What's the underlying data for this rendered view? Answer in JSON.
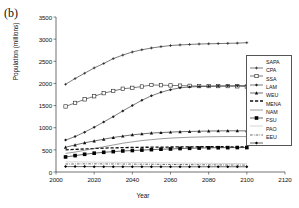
{
  "figure": {
    "panel_label": "(b)",
    "xlabel": "Year",
    "ylabel": "Population (millions)"
  },
  "axes": {
    "ytick_labels": [
      "3500",
      "3000",
      "2500",
      "2000",
      "1500",
      "1000",
      "500",
      "0"
    ],
    "xtick_labels": [
      "2000",
      "2020",
      "2040",
      "2060",
      "2080",
      "2100",
      "2120"
    ]
  },
  "legend": {
    "items": [
      {
        "label": "SAPA",
        "marker": "cross",
        "style": "solid",
        "color": "#222222"
      },
      {
        "label": "CPA",
        "marker": "open-square",
        "style": "solid",
        "color": "#222222"
      },
      {
        "label": "SSA",
        "marker": "small-diamond",
        "style": "solid",
        "color": "#222222"
      },
      {
        "label": "LAM",
        "marker": "filled-triangle",
        "style": "solid",
        "color": "#111111"
      },
      {
        "label": "WEU",
        "marker": "none",
        "style": "dashed-thick",
        "color": "#111111"
      },
      {
        "label": "MENA",
        "marker": "none",
        "style": "solid-thin",
        "color": "#666666"
      },
      {
        "label": "NAM",
        "marker": "filled-square",
        "style": "solid",
        "color": "#000000"
      },
      {
        "label": "FSU",
        "marker": "none",
        "style": "solid-light",
        "color": "#bbbbbb"
      },
      {
        "label": "PAO",
        "marker": "none",
        "style": "dash-dot",
        "color": "#444444"
      },
      {
        "label": "EEU",
        "marker": "filled-diamond",
        "style": "solid",
        "color": "#000000"
      }
    ]
  },
  "chart_data": {
    "type": "line",
    "title": "",
    "xlabel": "Year",
    "ylabel": "Population (millions)",
    "xlim": [
      2000,
      2120
    ],
    "ylim": [
      0,
      3500
    ],
    "xticks": [
      2000,
      2020,
      2040,
      2060,
      2080,
      2100,
      2120
    ],
    "yticks": [
      0,
      500,
      1000,
      1500,
      2000,
      2500,
      3000,
      3500
    ],
    "grid": false,
    "legend_position": "right",
    "x": [
      2005,
      2010,
      2015,
      2020,
      2025,
      2030,
      2035,
      2040,
      2045,
      2050,
      2055,
      2060,
      2065,
      2070,
      2075,
      2080,
      2085,
      2090,
      2095,
      2100
    ],
    "series": [
      {
        "name": "SAPA",
        "values": [
          1980,
          2110,
          2230,
          2350,
          2450,
          2560,
          2640,
          2710,
          2760,
          2800,
          2830,
          2855,
          2870,
          2880,
          2890,
          2895,
          2900,
          2905,
          2910,
          2920
        ]
      },
      {
        "name": "CPA",
        "values": [
          1480,
          1560,
          1640,
          1710,
          1780,
          1830,
          1880,
          1900,
          1930,
          1965,
          1960,
          1955,
          1950,
          1945,
          1940,
          1940,
          1940,
          1940,
          1935,
          1930
        ]
      },
      {
        "name": "SSA",
        "values": [
          720,
          800,
          900,
          1010,
          1130,
          1250,
          1380,
          1500,
          1620,
          1720,
          1800,
          1860,
          1900,
          1920,
          1930,
          1935,
          1940,
          1945,
          1950,
          1955
        ]
      },
      {
        "name": "LAM",
        "values": [
          560,
          610,
          660,
          700,
          740,
          780,
          810,
          840,
          860,
          880,
          890,
          900,
          910,
          915,
          920,
          925,
          928,
          930,
          930,
          928
        ]
      },
      {
        "name": "WEU",
        "values": [
          500,
          510,
          520,
          530,
          540,
          545,
          550,
          555,
          558,
          560,
          562,
          564,
          566,
          568,
          570,
          570,
          570,
          570,
          568,
          565
        ]
      },
      {
        "name": "MENA",
        "values": [
          420,
          450,
          490,
          530,
          570,
          610,
          650,
          680,
          710,
          730,
          750,
          765,
          775,
          785,
          790,
          795,
          798,
          800,
          800,
          800
        ]
      },
      {
        "name": "NAM",
        "values": [
          340,
          370,
          400,
          425,
          445,
          460,
          475,
          485,
          495,
          505,
          515,
          520,
          530,
          535,
          540,
          545,
          548,
          550,
          552,
          552
        ]
      },
      {
        "name": "FSU",
        "values": [
          230,
          228,
          226,
          224,
          222,
          220,
          218,
          215,
          212,
          210,
          208,
          205,
          202,
          200,
          198,
          196,
          194,
          192,
          190,
          188
        ]
      },
      {
        "name": "PAO",
        "values": [
          180,
          182,
          184,
          184,
          183,
          182,
          180,
          178,
          176,
          174,
          172,
          170,
          168,
          166,
          164,
          162,
          160,
          158,
          156,
          155
        ]
      },
      {
        "name": "EEU",
        "values": [
          122,
          122,
          122,
          121,
          121,
          120,
          120,
          120,
          119,
          119,
          119,
          118,
          118,
          118,
          118,
          118,
          118,
          118,
          118,
          118
        ]
      }
    ]
  }
}
